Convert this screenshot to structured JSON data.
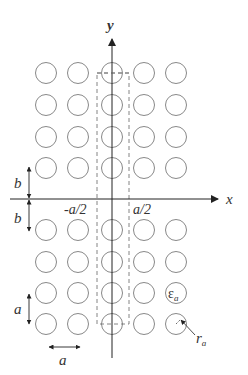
{
  "diagram": {
    "type": "photonic-crystal-lattice",
    "colors": {
      "stroke": "#7a7a7a",
      "axis": "#222222",
      "text": "#333333"
    },
    "lattice": {
      "columns_x": [
        46,
        78,
        112,
        144,
        176
      ],
      "rows_y": [
        73,
        105,
        137,
        168,
        230,
        262,
        293,
        324
      ],
      "radius": 10.5
    },
    "axes": {
      "x_label": "x",
      "y_label": "y"
    },
    "unit_cell": {
      "left_label": "-a/2",
      "right_label": "a/2"
    },
    "dimensions": {
      "b_upper": "b",
      "b_lower": "b",
      "a_vertical": "a",
      "a_horizontal": "a"
    },
    "annotations": {
      "permittivity": "ε",
      "permittivity_sub": "a",
      "radius": "r",
      "radius_sub": "a"
    }
  }
}
